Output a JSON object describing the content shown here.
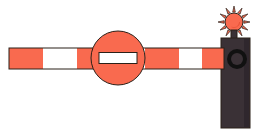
{
  "scene": {
    "title": "Road boom barrier with no-entry sign and warning lamp",
    "width": 265,
    "height": 135,
    "background_color": "#ffffff",
    "outline_color": "#2b2018"
  },
  "colors": {
    "orange": "#f96a4f",
    "orange_dark": "#e8543a",
    "white": "#ffffff",
    "post_dark": "#3a3136",
    "post_shadow": "#2e262b",
    "black": "#111111"
  },
  "barrier_arm": {
    "label": "barrier-arm",
    "x": 9,
    "y": 48,
    "width": 215,
    "height": 21,
    "stripe_pattern": "orange-white alternating",
    "stripes": [
      {
        "color": "#f96a4f",
        "x": 9,
        "width": 34
      },
      {
        "color": "#ffffff",
        "x": 43,
        "width": 34
      },
      {
        "color": "#f96a4f",
        "x": 77,
        "width": 34
      },
      {
        "color": "#ffffff",
        "x": 111,
        "width": 34
      },
      {
        "color": "#f96a4f",
        "x": 145,
        "width": 34
      },
      {
        "color": "#ffffff",
        "x": 179,
        "width": 23
      },
      {
        "color": "#f96a4f",
        "x": 202,
        "width": 22
      }
    ]
  },
  "no_entry_sign": {
    "label": "no-entry-sign",
    "center_x": 118,
    "center_y": 58,
    "radius": 27,
    "face_color": "#f96a4f",
    "bar_color": "#ffffff",
    "bar_width": 38,
    "bar_height": 11,
    "meaning": "no entry"
  },
  "post": {
    "label": "barrier-post",
    "x": 221,
    "y": 38,
    "width": 29,
    "height": 90,
    "color": "#3a3136"
  },
  "pivot": {
    "label": "arm-pivot",
    "center_x": 237,
    "center_y": 59,
    "outer_radius": 10,
    "inner_radius": 6,
    "color": "#111111"
  },
  "warning_lamp": {
    "label": "warning-lamp",
    "center_x": 234,
    "center_y": 22,
    "bulb_radius": 9,
    "ray_count": 12,
    "ray_length": 7,
    "color": "#f96a4f",
    "state": "flashing"
  },
  "lamp_mount": {
    "label": "lamp-mount",
    "x": 231,
    "y": 30,
    "width": 6,
    "height": 10,
    "color": "#3a3136"
  }
}
